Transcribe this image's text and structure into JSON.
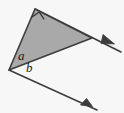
{
  "figure": {
    "background_color": "#f7f7f7",
    "canvas": {
      "width": 124,
      "height": 113
    },
    "shape": {
      "name": "triangle",
      "fill_color": "#a9a9a9",
      "stroke_color": "#3d3d3d",
      "stroke_width": 1.6,
      "vertices": [
        {
          "name": "left-vertex",
          "x": 9,
          "y": 70
        },
        {
          "name": "top-vertex",
          "x": 35,
          "y": 9
        },
        {
          "name": "right-vertex",
          "x": 92,
          "y": 38
        }
      ]
    },
    "right_angle_marker": {
      "name": "right-angle-square",
      "at_vertex": "top-vertex",
      "size": 9,
      "stroke_color": "#3d3d3d"
    },
    "labels": [
      {
        "name": "angle-label-a",
        "text": "a",
        "x": 18,
        "y": 60
      },
      {
        "name": "angle-label-b",
        "text": "b",
        "x": 26,
        "y": 72
      }
    ],
    "rays": [
      {
        "name": "upper-ray",
        "from": {
          "x": 35,
          "y": 9
        },
        "through": {
          "x": 92,
          "y": 38
        },
        "to": {
          "x": 121,
          "y": 52
        },
        "arrowhead_at": {
          "x": 112,
          "y": 47
        },
        "stroke_color": "#3d3d3d",
        "stroke_width": 1.6
      },
      {
        "name": "lower-ray",
        "from": {
          "x": 9,
          "y": 70
        },
        "to": {
          "x": 97,
          "y": 110
        },
        "arrowhead_at": {
          "x": 86,
          "y": 105
        },
        "stroke_color": "#3d3d3d",
        "stroke_width": 1.6
      }
    ]
  }
}
